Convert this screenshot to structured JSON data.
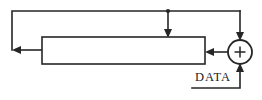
{
  "diagram": {
    "type": "block-diagram",
    "canvas": {
      "width": 262,
      "height": 100,
      "background": "#ffffff"
    },
    "style": {
      "line_color": "#262626",
      "fill_color": "#ffffff",
      "line_width": 1.6
    },
    "labels": {
      "data_input": "DATA",
      "adder_symbol": "+"
    },
    "nodes": [
      {
        "id": "delay-block",
        "kind": "rectangle",
        "label": "",
        "x": 42,
        "y": 37,
        "width": 163,
        "height": 27
      },
      {
        "id": "adder",
        "kind": "circle",
        "label": "+",
        "cx": 240,
        "cy": 52,
        "r": 12
      }
    ],
    "edges": [
      {
        "id": "block-output-left-feedback",
        "from": "delay-block.left",
        "to": "output-left",
        "arrow": "left",
        "points": "42,50 12,50"
      },
      {
        "id": "top-bus",
        "from": "adder.top",
        "to": "left-riser",
        "arrow": "none",
        "points": "240,11 12,11 12,50"
      },
      {
        "id": "tap-to-block-top",
        "from": "top-bus",
        "to": "delay-block.top",
        "arrow": "down",
        "points": "168,11 168,37"
      },
      {
        "id": "adder-to-block",
        "from": "adder.left",
        "to": "delay-block.right",
        "arrow": "left",
        "points": "228,52 205,52"
      },
      {
        "id": "adder-feedback-in",
        "from": "top-bus",
        "to": "adder.top",
        "arrow": "down",
        "points": "240,11 240,40"
      },
      {
        "id": "data-input",
        "from": "DATA",
        "to": "adder.bottom",
        "arrow": "up",
        "points": "192,88 240,88 240,64"
      }
    ],
    "junctions": [
      {
        "id": "tap-junction",
        "x": 168,
        "y": 11
      }
    ]
  }
}
